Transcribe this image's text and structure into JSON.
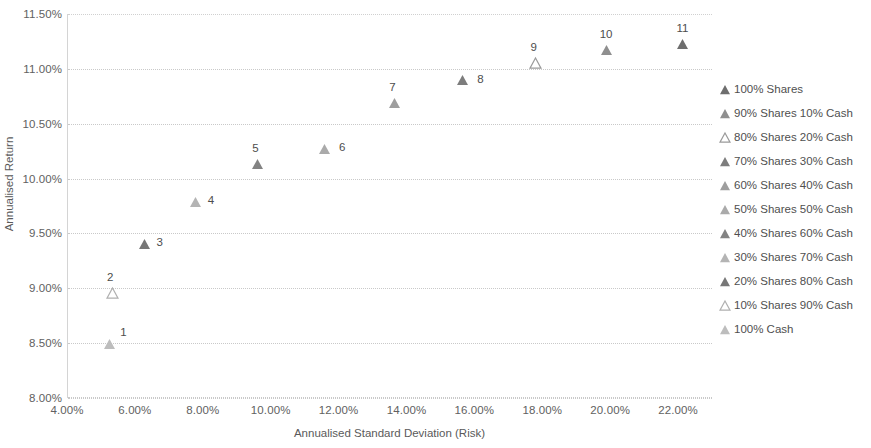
{
  "chart_data": {
    "type": "scatter",
    "title": "",
    "xlabel": "Annualised Standard Deviation (Risk)",
    "ylabel": "Annualised Return",
    "xlim": [
      4.0,
      23.0
    ],
    "ylim": [
      8.0,
      11.5
    ],
    "grid": true,
    "legend_position": "right",
    "x_ticks": [
      "4.00%",
      "6.00%",
      "8.00%",
      "10.00%",
      "12.00%",
      "14.00%",
      "16.00%",
      "18.00%",
      "20.00%",
      "22.00%"
    ],
    "x_tick_values": [
      4,
      6,
      8,
      10,
      12,
      14,
      16,
      18,
      20,
      22
    ],
    "y_ticks": [
      "8.00%",
      "8.50%",
      "9.00%",
      "9.50%",
      "10.00%",
      "10.50%",
      "11.00%",
      "11.50%"
    ],
    "y_tick_values": [
      8.0,
      8.5,
      9.0,
      9.5,
      10.0,
      10.5,
      11.0,
      11.5
    ],
    "series": [
      {
        "name": "100% Shares",
        "label": "11",
        "x": 22.1,
        "y": 11.23,
        "color": "#6e6e6e",
        "marker": "triangle-filled",
        "label_offset": [
          0,
          -16
        ]
      },
      {
        "name": "90% Shares 10% Cash",
        "label": "10",
        "x": 19.85,
        "y": 11.17,
        "color": "#8f8f8f",
        "marker": "triangle-filled",
        "label_offset": [
          0,
          -16
        ]
      },
      {
        "name": "80% Shares 20% Cash",
        "label": "9",
        "x": 17.78,
        "y": 11.05,
        "color": "#9a9a9a",
        "marker": "triangle-outline",
        "label_offset": [
          -2,
          -16
        ]
      },
      {
        "name": "70% Shares 30% Cash",
        "label": "8",
        "x": 15.62,
        "y": 10.9,
        "color": "#7d7d7d",
        "marker": "triangle-filled",
        "label_offset": [
          18,
          -1
        ]
      },
      {
        "name": "60% Shares 40% Cash",
        "label": "7",
        "x": 13.62,
        "y": 10.69,
        "color": "#9e9e9e",
        "marker": "triangle-filled",
        "label_offset": [
          -2,
          -16
        ]
      },
      {
        "name": "50% Shares 50% Cash",
        "label": "6",
        "x": 11.55,
        "y": 10.27,
        "color": "#aaaaaa",
        "marker": "triangle-filled",
        "label_offset": [
          18,
          -2
        ]
      },
      {
        "name": "40% Shares 60% Cash",
        "label": "5",
        "x": 9.58,
        "y": 10.13,
        "color": "#838383",
        "marker": "triangle-filled",
        "label_offset": [
          -2,
          -16
        ]
      },
      {
        "name": "30% Shares 70% Cash",
        "label": "4",
        "x": 7.77,
        "y": 9.79,
        "color": "#b4b4b4",
        "marker": "triangle-filled",
        "label_offset": [
          15,
          -2
        ]
      },
      {
        "name": "20% Shares 80% Cash",
        "label": "3",
        "x": 6.26,
        "y": 9.4,
        "color": "#777777",
        "marker": "triangle-filled",
        "label_offset": [
          15,
          -2
        ]
      },
      {
        "name": "10% Shares 90% Cash",
        "label": "2",
        "x": 5.3,
        "y": 8.96,
        "color": "#b0b0b0",
        "marker": "triangle-outline",
        "label_offset": [
          -2,
          -16
        ]
      },
      {
        "name": "100% Cash",
        "label": "1",
        "x": 5.22,
        "y": 8.49,
        "color": "#bdbdbd",
        "marker": "triangle-filled",
        "label_offset": [
          14,
          -12
        ]
      }
    ]
  },
  "legend": {
    "items": [
      {
        "label": "100% Shares",
        "color": "#6e6e6e",
        "marker": "triangle-filled"
      },
      {
        "label": "90% Shares 10% Cash",
        "color": "#8f8f8f",
        "marker": "triangle-filled"
      },
      {
        "label": "80% Shares 20% Cash",
        "color": "#9a9a9a",
        "marker": "triangle-outline"
      },
      {
        "label": "70% Shares 30% Cash",
        "color": "#7d7d7d",
        "marker": "triangle-filled"
      },
      {
        "label": "60% Shares 40% Cash",
        "color": "#9e9e9e",
        "marker": "triangle-filled"
      },
      {
        "label": "50% Shares 50% Cash",
        "color": "#aaaaaa",
        "marker": "triangle-filled"
      },
      {
        "label": "40% Shares 60% Cash",
        "color": "#838383",
        "marker": "triangle-filled"
      },
      {
        "label": "30% Shares 70% Cash",
        "color": "#b4b4b4",
        "marker": "triangle-filled"
      },
      {
        "label": "20% Shares 80% Cash",
        "color": "#777777",
        "marker": "triangle-filled"
      },
      {
        "label": "10% Shares 90% Cash",
        "color": "#b0b0b0",
        "marker": "triangle-outline"
      },
      {
        "label": "100% Cash",
        "color": "#bdbdbd",
        "marker": "triangle-filled"
      }
    ]
  },
  "theme": {
    "background": "#ffffff",
    "gridline_color": "#c9c9c9",
    "axis_color": "#d4d4d4",
    "text_color": "#595959"
  }
}
